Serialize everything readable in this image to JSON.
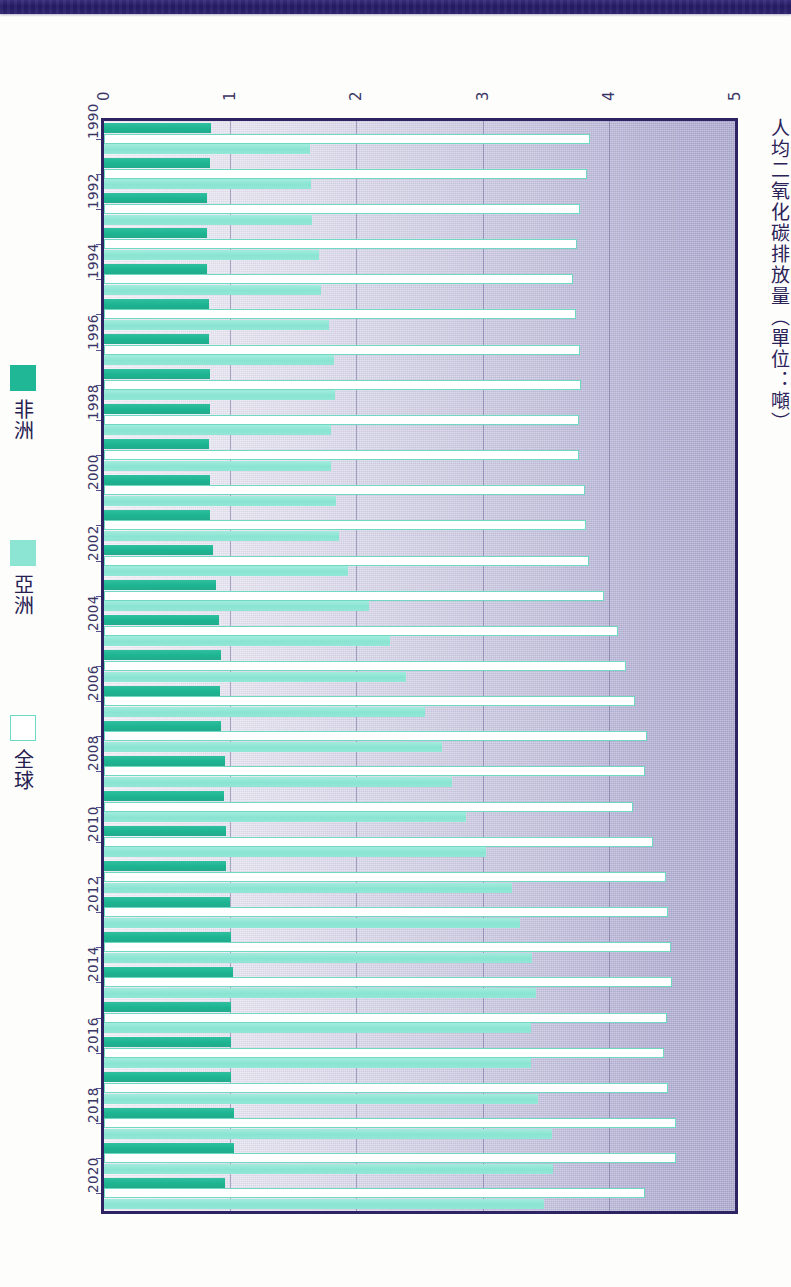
{
  "figure": {
    "axis_title": "人均二氧化碳排放量（單位：噸）",
    "orientation": "rotated-90"
  },
  "legend": {
    "position": "left",
    "items": [
      {
        "label": "非洲",
        "color": "#1fb795",
        "key": "africa"
      },
      {
        "label": "亞洲",
        "color": "#8ce5d3",
        "key": "asia"
      },
      {
        "label": "全球",
        "color": "#ffffff",
        "key": "global"
      }
    ]
  },
  "axes": {
    "value_ticks": [
      "0",
      "1",
      "2",
      "3",
      "4",
      "5"
    ],
    "value_min": 0,
    "value_max": 5,
    "category_ticks": [
      "1990",
      "1992",
      "1994",
      "1996",
      "1998",
      "2000",
      "2002",
      "2004",
      "2006",
      "2008",
      "2010",
      "2012",
      "2014",
      "2016",
      "2018",
      "2020"
    ]
  },
  "chart_data": {
    "type": "bar",
    "orientation": "horizontal",
    "title": "人均二氧化碳排放量（單位：噸）",
    "xlabel": "人均二氧化碳排放量（單位：噸）",
    "ylabel": "",
    "xlim": [
      0,
      5
    ],
    "grid": true,
    "legend_position": "left",
    "categories": [
      "1990",
      "1991",
      "1992",
      "1993",
      "1994",
      "1995",
      "1996",
      "1997",
      "1998",
      "1999",
      "2000",
      "2001",
      "2002",
      "2003",
      "2004",
      "2005",
      "2006",
      "2007",
      "2008",
      "2009",
      "2010",
      "2011",
      "2012",
      "2013",
      "2014",
      "2015",
      "2016",
      "2017",
      "2018",
      "2019",
      "2020"
    ],
    "series": [
      {
        "name": "非洲",
        "color": "#1fb795",
        "values": [
          0.85,
          0.84,
          0.82,
          0.82,
          0.82,
          0.83,
          0.83,
          0.84,
          0.84,
          0.83,
          0.84,
          0.84,
          0.86,
          0.89,
          0.91,
          0.93,
          0.92,
          0.93,
          0.96,
          0.95,
          0.97,
          0.97,
          1.0,
          1.01,
          1.02,
          1.01,
          1.01,
          1.01,
          1.03,
          1.03,
          0.96
        ]
      },
      {
        "name": "全球",
        "color": "#ffffff",
        "values": [
          3.85,
          3.83,
          3.77,
          3.75,
          3.72,
          3.74,
          3.77,
          3.78,
          3.76,
          3.76,
          3.81,
          3.82,
          3.84,
          3.96,
          4.07,
          4.14,
          4.21,
          4.3,
          4.29,
          4.19,
          4.35,
          4.45,
          4.47,
          4.49,
          4.5,
          4.46,
          4.44,
          4.47,
          4.53,
          4.53,
          4.29
        ]
      },
      {
        "name": "亞洲",
        "color": "#8ce5d3",
        "values": [
          1.63,
          1.64,
          1.65,
          1.7,
          1.72,
          1.78,
          1.82,
          1.83,
          1.8,
          1.8,
          1.84,
          1.86,
          1.93,
          2.1,
          2.27,
          2.39,
          2.54,
          2.68,
          2.76,
          2.87,
          3.03,
          3.23,
          3.3,
          3.39,
          3.42,
          3.38,
          3.38,
          3.44,
          3.55,
          3.56,
          3.49
        ]
      }
    ]
  }
}
